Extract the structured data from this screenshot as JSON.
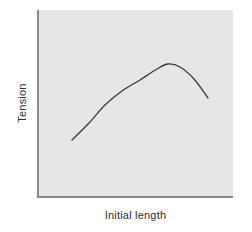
{
  "chart_data": {
    "type": "line",
    "title": "",
    "subtitle": "",
    "xlabel": "Initial length",
    "ylabel": "Tension",
    "xticklabels": [],
    "yticklabels": [],
    "grid": false,
    "legend": null,
    "legend_position": "none",
    "xlim": [
      0,
      1
    ],
    "ylim": [
      0,
      1
    ],
    "axis_style": "open-left-bottom",
    "panel_color": "#e6e6e6",
    "axis_color": "#8a8a8a",
    "curve_color": "#3a3a3a",
    "annotations": [],
    "series": [
      {
        "name": "Length-tension relation",
        "shape": "inverted-u",
        "x": [
          0.175,
          0.26,
          0.345,
          0.43,
          0.52,
          0.605,
          0.667,
          0.73,
          0.8,
          0.872
        ],
        "y": [
          0.305,
          0.395,
          0.49,
          0.575,
          0.65,
          0.705,
          0.712,
          0.695,
          0.635,
          0.53
        ],
        "points_px": [
          [
            72,
            140
          ],
          [
            89,
            123
          ],
          [
            105,
            105
          ],
          [
            122,
            91
          ],
          [
            140,
            80
          ],
          [
            157,
            69
          ],
          [
            168,
            64
          ],
          [
            180,
            67
          ],
          [
            194,
            79
          ],
          [
            208,
            98
          ]
        ],
        "peak_px": [
          168,
          64
        ],
        "start_px": [
          72,
          140
        ],
        "end_px": [
          208,
          98
        ]
      }
    ]
  },
  "figure": {
    "axis_titles": {
      "y": "Tension",
      "x": "Initial length"
    }
  }
}
